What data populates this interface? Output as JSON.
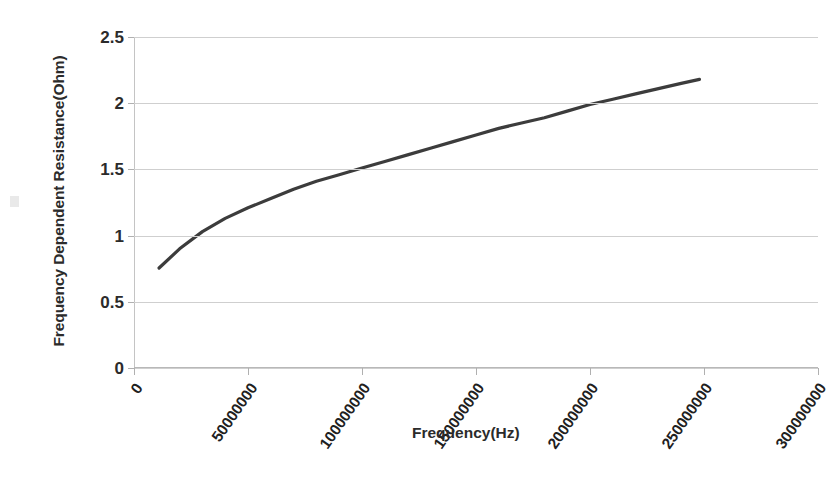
{
  "chart_data": {
    "type": "line",
    "title": "",
    "xlabel": "Frequency(Hz)",
    "ylabel": "Frequency Dependent Resistance(Ohm)",
    "xlim": [
      0,
      300000000
    ],
    "ylim": [
      0,
      2.5
    ],
    "grid": true,
    "legend": "none",
    "x_tick_labels": [
      "0",
      "50000000",
      "100000000",
      "150000000",
      "200000000",
      "250000000",
      "300000000"
    ],
    "x_tick_values": [
      0,
      50000000,
      100000000,
      150000000,
      200000000,
      250000000,
      300000000
    ],
    "y_tick_labels": [
      "0",
      "0.5",
      "1",
      "1.5",
      "2",
      "2.5"
    ],
    "y_tick_values": [
      0,
      0.5,
      1,
      1.5,
      2,
      2.5
    ],
    "series": [
      {
        "name": "Frequency Dependent Resistance",
        "color": "#3c3c3c",
        "line_width": 3.2,
        "x": [
          11000000,
          20000000,
          30000000,
          40000000,
          50000000,
          60000000,
          70000000,
          80000000,
          90000000,
          100000000,
          110000000,
          120000000,
          130000000,
          140000000,
          150000000,
          160000000,
          170000000,
          180000000,
          190000000,
          200000000,
          210000000,
          220000000,
          230000000,
          240000000,
          248000000
        ],
        "y": [
          0.755,
          0.9,
          1.03,
          1.13,
          1.21,
          1.28,
          1.35,
          1.41,
          1.46,
          1.51,
          1.56,
          1.61,
          1.66,
          1.71,
          1.76,
          1.81,
          1.85,
          1.89,
          1.94,
          1.99,
          2.03,
          2.07,
          2.11,
          2.15,
          2.18
        ]
      }
    ]
  },
  "axes": {
    "y_title": "Frequency Dependent Resistance(Ohm)",
    "x_title": "Frequency(Hz)"
  }
}
